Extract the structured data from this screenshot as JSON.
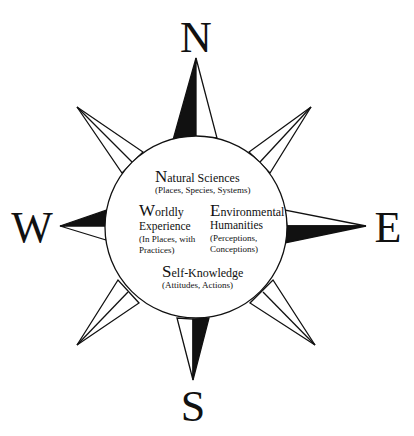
{
  "compass": {
    "north": "N",
    "south": "S",
    "east": "E",
    "west": "W"
  },
  "sections": {
    "north": {
      "initial": "N",
      "title_rest": "atural Sciences",
      "subtitle": "(Places, Species, Systems)"
    },
    "west": {
      "initial": "W",
      "title_rest": "orldly",
      "line2": "Experience",
      "line3": "(In Places, with",
      "line4": "Practices)"
    },
    "east": {
      "initial": "E",
      "title_rest": "nvironmental",
      "line2": "Humanities",
      "line3": "(Perceptions,",
      "line4": "Conceptions)"
    },
    "south": {
      "initial": "S",
      "title_rest": "elf-Knowledge",
      "subtitle": "(Attitudes, Actions)"
    }
  },
  "colors": {
    "ink": "#111111",
    "background": "#ffffff"
  }
}
